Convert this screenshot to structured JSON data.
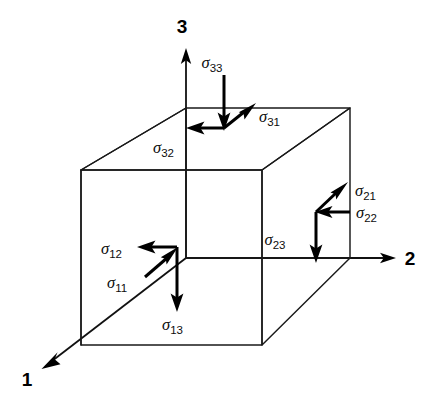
{
  "figure": {
    "type": "stress-tensor-cube-diagram",
    "background_color": "#ffffff",
    "line_color": "#1a1a1a"
  },
  "axes": [
    {
      "id": "axis-1",
      "label": "1",
      "label_x": 27,
      "label_y": 386,
      "direction": "down-left-front"
    },
    {
      "id": "axis-2",
      "label": "2",
      "label_x": 410,
      "label_y": 265,
      "direction": "right"
    },
    {
      "id": "axis-3",
      "label": "3",
      "label_x": 182,
      "label_y": 33,
      "direction": "up"
    }
  ],
  "stress_labels": [
    {
      "id": "sigma-33",
      "symbol": "σ",
      "subscript": "33",
      "x": 212,
      "y": 68,
      "face": "top",
      "component": "normal"
    },
    {
      "id": "sigma-31",
      "symbol": "σ",
      "subscript": "31",
      "x": 259,
      "y": 122,
      "face": "top",
      "component": "shear"
    },
    {
      "id": "sigma-32",
      "symbol": "σ",
      "subscript": "32",
      "x": 153,
      "y": 153,
      "face": "top",
      "component": "shear"
    },
    {
      "id": "sigma-21",
      "symbol": "σ",
      "subscript": "21",
      "x": 355,
      "y": 196,
      "face": "right",
      "component": "shear"
    },
    {
      "id": "sigma-22",
      "symbol": "σ",
      "subscript": "22",
      "x": 356,
      "y": 218,
      "face": "right",
      "component": "normal"
    },
    {
      "id": "sigma-23",
      "symbol": "σ",
      "subscript": "23",
      "x": 275,
      "y": 245,
      "face": "right",
      "component": "shear"
    },
    {
      "id": "sigma-12",
      "symbol": "σ",
      "subscript": "12",
      "x": 101,
      "y": 254,
      "face": "front",
      "component": "shear"
    },
    {
      "id": "sigma-11",
      "symbol": "σ",
      "subscript": "11",
      "x": 107,
      "y": 288,
      "face": "front",
      "component": "normal"
    },
    {
      "id": "sigma-13",
      "symbol": "σ",
      "subscript": "13",
      "x": 162,
      "y": 330,
      "face": "front",
      "component": "shear"
    }
  ]
}
